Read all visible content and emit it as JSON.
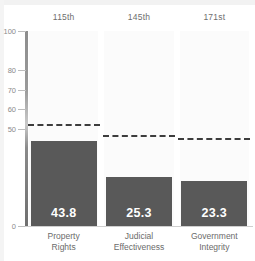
{
  "chart_data": {
    "type": "bar",
    "title": "",
    "subtitle": "",
    "xlabel": "",
    "ylabel": "",
    "categories": [
      "Property Rights",
      "Judicial Effectiveness",
      "Government Integrity"
    ],
    "values": [
      43.8,
      25.3,
      23.3
    ],
    "value_labels": [
      "43.8",
      "25.3",
      "23.3"
    ],
    "rank_labels": [
      "115th",
      "145th",
      "171st"
    ],
    "reference_lines": [
      51.5,
      45.5,
      44.0
    ],
    "ylim": [
      0,
      100
    ],
    "yticks": [
      100,
      80,
      70,
      60,
      50,
      0
    ],
    "ytick_labels": [
      "100",
      "80",
      "70",
      "60",
      "50",
      "0"
    ],
    "grid": false,
    "legend": "none",
    "series": [
      {
        "name": "Score",
        "values": [
          43.8,
          25.3,
          23.3
        ]
      }
    ],
    "colors": {
      "bar": "#595959",
      "reference_line": "#3d3d3d",
      "panel_background": "#fbfbfb",
      "axis": "#8d8d8d",
      "tick_label": "#8a8a8a",
      "category_label": "#6b6b6b",
      "rank_label": "#6e6e6e",
      "value_label": "#ffffff"
    }
  }
}
